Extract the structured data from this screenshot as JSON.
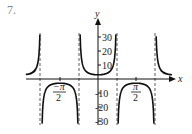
{
  "problem_number": "7.",
  "chart_data": {
    "type": "line",
    "function": "y = 3 sec(2x) (graph of secant-type function)",
    "title": "",
    "xlabel": "x",
    "ylabel": "y",
    "x_tick_labels": [
      "-π/2",
      "π/2"
    ],
    "y_tick_labels": [
      "30",
      "20",
      "10",
      "-10",
      "-20",
      "-30"
    ],
    "y_ticks": [
      30,
      20,
      10,
      -10,
      -20,
      -30
    ],
    "asymptotes_x": [
      "-3π/4",
      "-π/4",
      "π/4",
      "3π/4"
    ],
    "ylim": [
      -32,
      32
    ],
    "grid": false,
    "local_extrema": [
      {
        "x": "-π/2",
        "y": -3
      },
      {
        "x": "0",
        "y": 3
      },
      {
        "x": "π/2",
        "y": -3
      }
    ]
  },
  "labels": {
    "x_axis": "x",
    "y_axis": "y",
    "neg_pi": "−π",
    "pi": "π",
    "two": "2"
  }
}
